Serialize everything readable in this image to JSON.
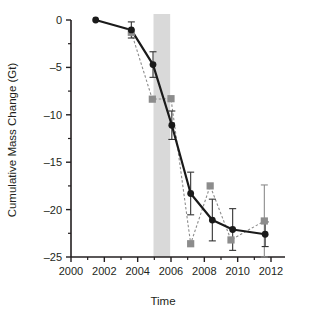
{
  "chart_data": {
    "type": "line",
    "title": "",
    "xlabel": "Time",
    "ylabel": "Cumulative Mass Change (Gt)",
    "xlim": [
      2000,
      2012
    ],
    "ylim": [
      -25,
      0
    ],
    "xticks": [
      2000,
      2002,
      2004,
      2006,
      2008,
      2010,
      2012
    ],
    "xtick_labels": [
      "2000",
      "2002",
      "2004",
      "2006",
      "2008",
      "2010",
      "2012"
    ],
    "xminor_ticks": [
      2001,
      2003,
      2005,
      2007,
      2009,
      2011
    ],
    "yticks": [
      0,
      -5,
      -10,
      -15,
      -20,
      -25
    ],
    "ytick_labels": [
      "0",
      "–5",
      "–10",
      "–15",
      "–20",
      "–25"
    ],
    "yminor_ticks": [
      -2.5,
      -7.5,
      -12.5,
      -17.5,
      -22.5
    ],
    "grid": false,
    "legend_position": "none",
    "annotations": [
      {
        "name": "highlight-band",
        "type": "vspan",
        "x_start": 2004.95,
        "x_end": 2005.95,
        "color": "#d9d9d9"
      }
    ],
    "series": [
      {
        "name": "black-circles",
        "marker": "circle",
        "color": "#1a1a1a",
        "linestyle": "solid",
        "x": [
          2001.48,
          2003.62,
          2004.92,
          2006.05,
          2007.18,
          2008.48,
          2009.7,
          2011.65
        ],
        "y": [
          0.0,
          -1.05,
          -4.7,
          -11.1,
          -18.3,
          -21.1,
          -22.1,
          -22.6
        ],
        "yerr": [
          0.0,
          0.85,
          1.35,
          1.5,
          2.25,
          2.2,
          2.2,
          1.3
        ]
      },
      {
        "name": "gray-squares",
        "marker": "square",
        "color": "#8c8c8c",
        "linestyle": "dashed",
        "x": [
          2003.62,
          2004.88,
          2006.0,
          2007.18,
          2008.35,
          2009.6,
          2011.6
        ],
        "y": [
          -1.3,
          -8.35,
          -8.3,
          -23.6,
          -17.5,
          -23.2,
          -21.2
        ],
        "yerr": [
          0.0,
          0.0,
          0.0,
          0.0,
          0.0,
          0.0,
          3.8
        ]
      }
    ]
  },
  "figure": {
    "axis_color": "#231f20",
    "background": "#ffffff"
  }
}
